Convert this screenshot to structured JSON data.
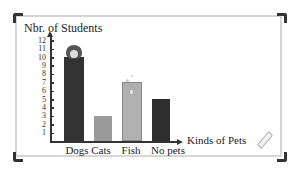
{
  "chart_data": {
    "type": "bar",
    "title": "",
    "xlabel": "Kinds of Pets",
    "ylabel": "Nbr. of Students",
    "categories": [
      "Dogs",
      "Cats",
      "Fish",
      "No pets"
    ],
    "values": [
      10,
      3,
      7,
      5
    ],
    "bar_colors": [
      "#333333",
      "#9a9a9a",
      "#b0b0b0",
      "#2e2e2e"
    ],
    "yticks": [
      1,
      2,
      3,
      4,
      5,
      6,
      7,
      8,
      9,
      10,
      11,
      12
    ],
    "ylim": [
      0,
      12
    ],
    "grid": false,
    "legend": null,
    "annotations": [
      "dog icon atop Dogs bar",
      "fish bubbles atop Fish bar",
      "pencil icon bottom-right"
    ]
  },
  "labels": {
    "ytitle": "Nbr. of Students",
    "xtitle": "Kinds of Pets",
    "ticks": [
      "1",
      "2",
      "3",
      "4",
      "5",
      "6",
      "7",
      "8",
      "9",
      "10",
      "11",
      "12"
    ],
    "categories": [
      "Dogs",
      "Cats",
      "Fish",
      "No pets"
    ]
  }
}
